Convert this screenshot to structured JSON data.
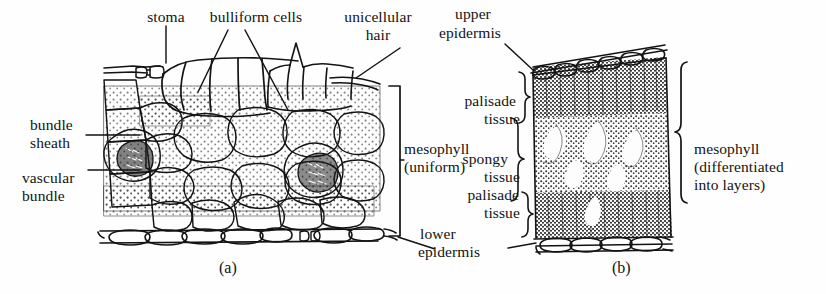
{
  "figure": {
    "kind": "botanical-diagram",
    "background_color": "#fefefe",
    "ink_color": "#131313"
  },
  "panels": [
    {
      "id": "a",
      "caption": "(a)",
      "type": "monocot-grass-leaf-section"
    },
    {
      "id": "b",
      "caption": "(b)",
      "type": "dicot-leaf-section"
    }
  ],
  "labels": {
    "stoma": "stoma",
    "bulliform_cells": "bulliform cells",
    "unicellular_hair_l1": "unicellular",
    "unicellular_hair_l2": "hair",
    "bundle_sheath_l1": "bundle",
    "bundle_sheath_l2": "sheath",
    "vascular_bundle_l1": "vascular",
    "vascular_bundle_l2": "bundle",
    "mesophyll_uniform_l1": "mesophyll",
    "mesophyll_uniform_l2": "(uniform)",
    "upper_epidermis_l1": "upper",
    "upper_epidermis_l2": "epidermis",
    "lower_epidermis_l1": "lower",
    "lower_epidermis_l2": "epidermis",
    "palisade_tissue_top_l1": "palisade",
    "palisade_tissue_top_l2": "tissue",
    "spongy_tissue_l1": "spongy",
    "spongy_tissue_l2": "tissue",
    "palisade_tissue_bottom_l1": "palisade",
    "palisade_tissue_bottom_l2": "tissue",
    "mesophyll_diff_l1": "mesophyll",
    "mesophyll_diff_l2": "(differentiated",
    "mesophyll_diff_l3": "into layers)"
  },
  "captions": {
    "panel_a": "(a)",
    "panel_b": "(b)"
  }
}
